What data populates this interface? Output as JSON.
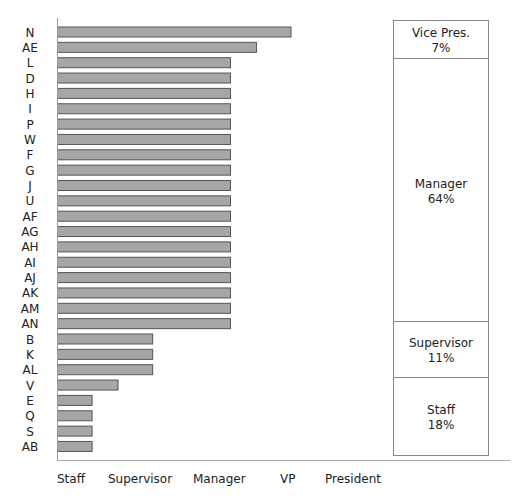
{
  "chart_data": {
    "type": "bar",
    "orientation": "horizontal",
    "title": "",
    "xlabel": "",
    "ylabel": "",
    "categories": [
      "N",
      "AE",
      "L",
      "D",
      "H",
      "I",
      "P",
      "W",
      "F",
      "G",
      "J",
      "U",
      "AF",
      "AG",
      "AH",
      "AI",
      "AJ",
      "AK",
      "AM",
      "AN",
      "B",
      "K",
      "AL",
      "V",
      "E",
      "Q",
      "S",
      "AB"
    ],
    "values": [
      6.75,
      5.75,
      5,
      5,
      5,
      5,
      5,
      5,
      5,
      5,
      5,
      5,
      5,
      5,
      5,
      5,
      5,
      5,
      5,
      5,
      2.75,
      2.75,
      2.75,
      1.75,
      1,
      1,
      1,
      1
    ],
    "xlim": [
      0,
      10
    ],
    "x_tick_labels": [
      "Staff",
      "Supervisor",
      "Manager",
      "VP",
      "President"
    ],
    "grid": false,
    "bar_color": "#a6a6a6",
    "bar_edge_color": "#555555",
    "stacked_panel": {
      "segments": [
        {
          "label": "Vice Pres.",
          "percent": "7%",
          "share": 7
        },
        {
          "label": "Manager",
          "percent": "64%",
          "share": 64
        },
        {
          "label": "Supervisor",
          "percent": "11%",
          "share": 11
        },
        {
          "label": "Staff",
          "percent": "18%",
          "share": 18
        }
      ]
    }
  }
}
